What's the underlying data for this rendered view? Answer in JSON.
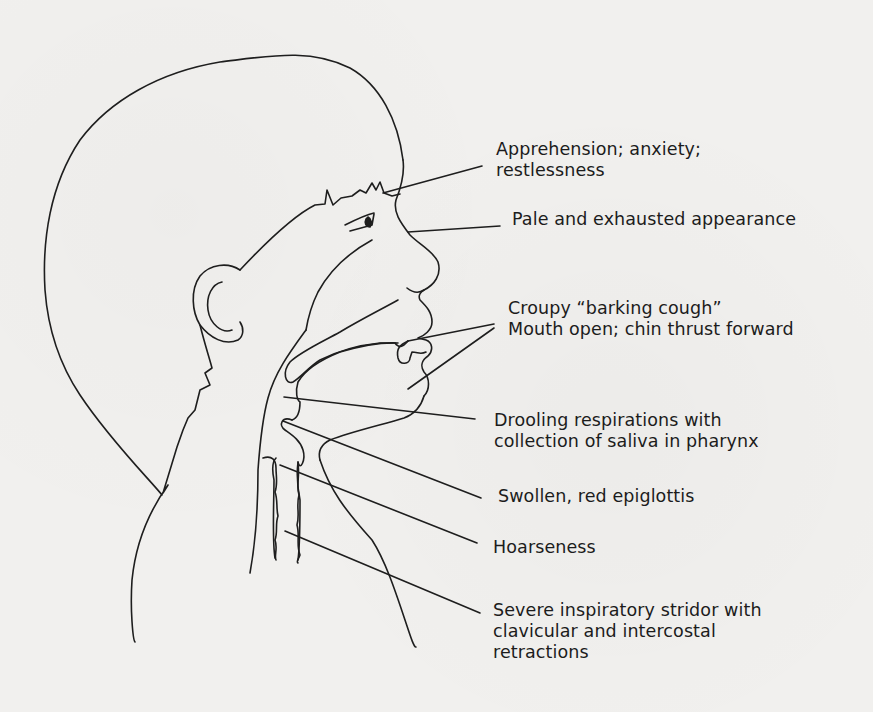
{
  "figure": {
    "colors": {
      "background": "#f1f0ee",
      "ink": "#1e1e1e"
    }
  },
  "labels": [
    {
      "id": "apprehension",
      "lines": [
        "Apprehension; anxiety;",
        "restlessness"
      ]
    },
    {
      "id": "pale",
      "lines": [
        "Pale and exhausted appearance"
      ]
    },
    {
      "id": "croupy",
      "lines": [
        "Croupy “barking cough”",
        "Mouth open; chin thrust forward"
      ]
    },
    {
      "id": "drooling",
      "lines": [
        "Drooling respirations with",
        "collection of saliva in pharynx"
      ]
    },
    {
      "id": "epiglottis",
      "lines": [
        "Swollen, red epiglottis"
      ]
    },
    {
      "id": "hoarseness",
      "lines": [
        "Hoarseness"
      ]
    },
    {
      "id": "stridor",
      "lines": [
        "Severe inspiratory stridor with",
        "clavicular and intercostal",
        "retractions"
      ]
    }
  ]
}
